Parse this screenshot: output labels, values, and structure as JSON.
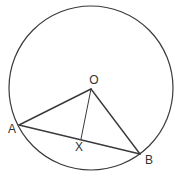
{
  "diagram": {
    "type": "circle-geometry",
    "colors": {
      "stroke": "#3a3a3a",
      "text": "#333333",
      "background": "#ffffff"
    },
    "circle": {
      "cx": 91,
      "cy": 88,
      "r": 82
    },
    "points": {
      "O": {
        "x": 91,
        "y": 89,
        "label": "O",
        "lx": 94,
        "ly": 84
      },
      "A": {
        "x": 19,
        "y": 125,
        "label": "A",
        "lx": 12,
        "ly": 133
      },
      "B": {
        "x": 140,
        "y": 154,
        "label": "B",
        "lx": 149,
        "ly": 164
      },
      "X": {
        "x": 81,
        "y": 139,
        "label": "X",
        "lx": 79,
        "ly": 151
      }
    },
    "segments": [
      {
        "from": "O",
        "to": "A"
      },
      {
        "from": "O",
        "to": "B"
      },
      {
        "from": "A",
        "to": "B"
      },
      {
        "from": "O",
        "to": "X"
      }
    ]
  }
}
